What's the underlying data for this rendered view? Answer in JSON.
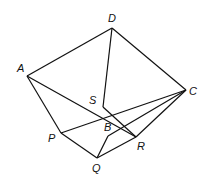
{
  "diagram": {
    "type": "geometric-solid",
    "vertices": [
      {
        "id": "D",
        "label": "D",
        "x": 112,
        "y": 28,
        "lx": 108,
        "ly": 22
      },
      {
        "id": "A",
        "label": "A",
        "x": 27,
        "y": 76,
        "lx": 17,
        "ly": 72
      },
      {
        "id": "C",
        "label": "C",
        "x": 186,
        "y": 90,
        "lx": 189,
        "ly": 95
      },
      {
        "id": "S",
        "label": "S",
        "x": 103,
        "y": 107,
        "lx": 89,
        "ly": 104
      },
      {
        "id": "B",
        "label": "B",
        "x": 108,
        "y": 136,
        "lx": 104,
        "ly": 131
      },
      {
        "id": "P",
        "label": "P",
        "x": 61,
        "y": 133,
        "lx": 48,
        "ly": 142
      },
      {
        "id": "Q",
        "label": "Q",
        "x": 97,
        "y": 158,
        "lx": 92,
        "ly": 172
      },
      {
        "id": "R",
        "label": "R",
        "x": 136,
        "y": 137,
        "lx": 137,
        "ly": 150
      }
    ],
    "edges": [
      [
        "A",
        "D"
      ],
      [
        "D",
        "C"
      ],
      [
        "D",
        "S"
      ],
      [
        "A",
        "P"
      ],
      [
        "A",
        "R"
      ],
      [
        "C",
        "P"
      ],
      [
        "C",
        "R"
      ],
      [
        "S",
        "R"
      ],
      [
        "P",
        "Q"
      ],
      [
        "Q",
        "R"
      ],
      [
        "Q",
        "B"
      ],
      [
        "B",
        "C"
      ]
    ]
  }
}
